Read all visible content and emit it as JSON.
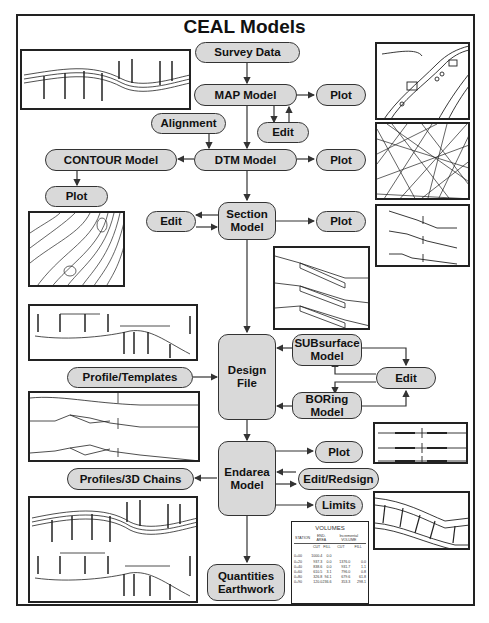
{
  "title": "CEAL Models",
  "nodes": {
    "survey_data": "Survey Data",
    "map_model": "MAP Model",
    "map_plot": "Plot",
    "map_edit": "Edit",
    "alignment": "Alignment",
    "dtm_model": "DTM Model",
    "dtm_plot": "Plot",
    "contour_model": "CONTOUR Model",
    "contour_plot": "Plot",
    "section_model": "Section\nModel",
    "section_edit": "Edit",
    "section_plot": "Plot",
    "design_file": "Design\nFile",
    "subsurface_model": "SUBsurface\nModel",
    "boring_model": "BORing\nModel",
    "sub_edit": "Edit",
    "profile_templates": "Profile/Templates",
    "endarea_model": "Endarea\nModel",
    "endarea_plot": "Plot",
    "edit_redesign": "Edit/Redsign",
    "limits": "Limits",
    "profiles_3d": "Profiles/3D Chains",
    "quantities": "Quantities\nEarthwork"
  },
  "volumes_table": {
    "title": "VOLUMES",
    "group_headers": [
      "STATION",
      "END-AREA",
      "Incremental VOLUME"
    ],
    "sub_headers": [
      "",
      "CUT",
      "FILL",
      "CUT",
      "FILL"
    ],
    "rows": [
      [
        "0+00",
        "1000.4",
        "0.0",
        "",
        ""
      ],
      [
        "0+20",
        "937.3",
        "0.0",
        "1376.0",
        "0.0"
      ],
      [
        "0+40",
        "838.6",
        "0.0",
        "931.7",
        "1.1"
      ],
      [
        "0+60",
        "610.5",
        "3.1",
        "796.0",
        "0.8"
      ],
      [
        "0+80",
        "326.8",
        "94.1",
        "679.6",
        "61.8"
      ],
      [
        "0+90",
        "120.0",
        "236.6",
        "353.3",
        "298.1"
      ]
    ]
  },
  "colors": {
    "node_fill": "#d9d9d9",
    "line": "#333333"
  }
}
